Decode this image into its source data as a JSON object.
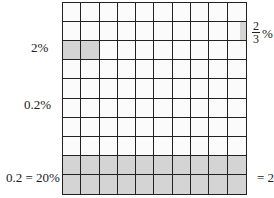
{
  "grid": {
    "rows": 10,
    "cols": 10,
    "shaded_cells": [
      [
        2,
        0
      ],
      [
        2,
        1
      ],
      [
        8,
        0
      ],
      [
        8,
        1
      ],
      [
        8,
        2
      ],
      [
        8,
        3
      ],
      [
        8,
        4
      ],
      [
        8,
        5
      ],
      [
        8,
        6
      ],
      [
        8,
        7
      ],
      [
        8,
        8
      ],
      [
        8,
        9
      ],
      [
        9,
        0
      ],
      [
        9,
        1
      ],
      [
        9,
        2
      ],
      [
        9,
        3
      ],
      [
        9,
        4
      ],
      [
        9,
        5
      ],
      [
        9,
        6
      ],
      [
        9,
        7
      ],
      [
        9,
        8
      ],
      [
        9,
        9
      ]
    ],
    "partial_cell": {
      "row": 1,
      "col": 9,
      "fraction": "1/3"
    },
    "shade_color": "#d4d4d4",
    "line_color": "#222222"
  },
  "labels": {
    "two_percent": "2%",
    "point_two_percent": "0.2%",
    "point_two_eq": "0.2 = 20%",
    "right_eq": "= 20",
    "frac_num": "2",
    "frac_den": "3",
    "frac_pct": "%"
  }
}
